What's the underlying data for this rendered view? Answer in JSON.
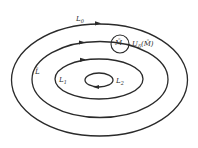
{
  "diagram": {
    "type": "nested-closed-curves",
    "stroke_color": "#2a2a2a",
    "background": "#ffffff",
    "curves": [
      {
        "id": "L0",
        "label": "L",
        "subscript": "0",
        "cx": 99.5,
        "cy": 80,
        "rx": 88,
        "ry": 56
      },
      {
        "id": "L",
        "label": "L",
        "overline": true,
        "cx": 100,
        "cy": 79.5,
        "rx": 68,
        "ry": 38
      },
      {
        "id": "L1",
        "label": "L",
        "subscript": "1",
        "cx": 99,
        "cy": 79,
        "rx": 44,
        "ry": 20
      },
      {
        "id": "L2",
        "label": "L",
        "subscript": "2",
        "cx": 99,
        "cy": 80,
        "rx": 14,
        "ry": 7
      }
    ],
    "point": {
      "label": "M",
      "overline": true
    },
    "neighborhood": {
      "label": "U",
      "subscript": "δ",
      "argument": "(M̄)",
      "full_text": "Uδ(M̄)"
    },
    "labels": {
      "L0": "L",
      "L0_sub": "0",
      "Lbar": "L̄",
      "L1": "L",
      "L1_sub": "1",
      "L2": "L",
      "L2_sub": "2",
      "M": "M̄",
      "U": "U",
      "U_sub": "δ",
      "U_arg": "(M̄)"
    }
  }
}
